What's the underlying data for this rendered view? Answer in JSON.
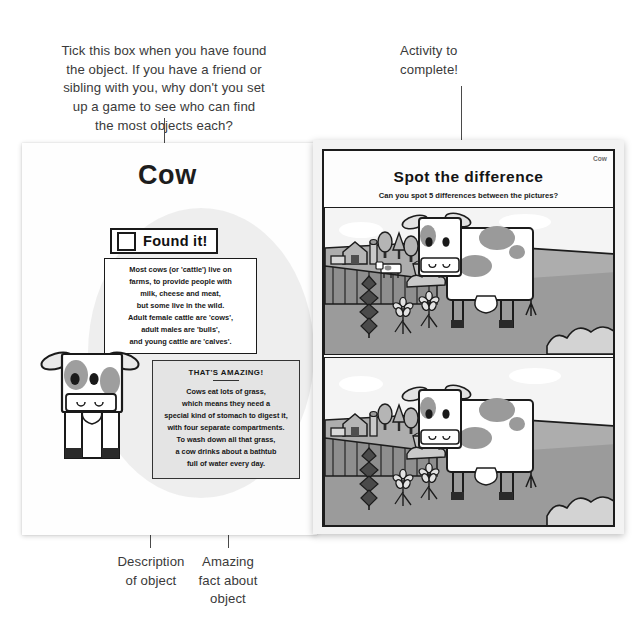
{
  "annotations": {
    "top_left": [
      "Tick this box when you have found",
      "the object. If you have a friend or",
      "sibling with you, why don't you set",
      "up a game to see who can find",
      "the most objects each?"
    ],
    "top_right": [
      "Activity to",
      "complete!"
    ],
    "bottom_left": [
      "Description",
      "of object"
    ],
    "bottom_right": [
      "Amazing",
      "fact about",
      "object"
    ]
  },
  "left_page": {
    "title": "Cow",
    "found_it_label": "Found it!",
    "description_lines": [
      "Most cows (or 'cattle') live on",
      "farms, to provide people with",
      "milk, cheese and meat,",
      "but some live in the wild.",
      "Adult female cattle are 'cows',",
      "adult males are 'bulls',",
      "and young cattle are 'calves'."
    ],
    "fact_heading": "THAT'S AMAZING!",
    "fact_lines": [
      "Cows eat lots of grass,",
      "which means they need a",
      "special kind of stomach to digest it,",
      "with four separate compartments.",
      "To wash down all that grass,",
      "a cow drinks about a bathtub",
      "full of water every day."
    ],
    "illustration": "cow-front-illustration"
  },
  "right_page": {
    "corner_label": "Cow",
    "activity_title": "Spot the difference",
    "activity_subtitle": "Can you spot 5 differences between the pictures?",
    "panels": [
      {
        "name": "spot-difference-panel-top",
        "scene": "farm-scene-with-cow"
      },
      {
        "name": "spot-difference-panel-bottom",
        "scene": "farm-scene-with-cow"
      }
    ]
  },
  "colors": {
    "ink": "#1a1a1a",
    "leader": "#4a4a4a",
    "grass": "#a8a8a8",
    "grass_dark": "#8f8f8f",
    "sky": "#f2f2f2",
    "patch": "#9a9a9a",
    "fact_bg": "#e4e4e4",
    "blob": "#ededed"
  }
}
